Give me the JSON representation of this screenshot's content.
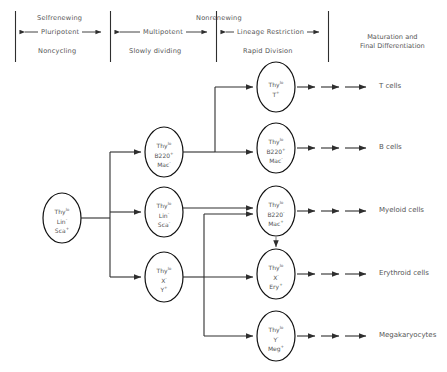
{
  "diagram": {
    "colors": {
      "line": "#3a3a3a",
      "text": "#555555",
      "oval_stroke": "#1a1a1a",
      "background": "#ffffff"
    },
    "stages": [
      {
        "id": "pluripotent",
        "top_label": "Selfrenewing",
        "arrow_label": "Pluripotent",
        "bottom_label": "Noncycling"
      },
      {
        "id": "multipotent",
        "top_label": "",
        "arrow_label": "Multipotent",
        "bottom_label": "Slowly dividing"
      },
      {
        "id": "lineage-restriction",
        "top_label": "Nonrenewing",
        "arrow_label": "Lineage Restriction",
        "bottom_label": "Rapid Division"
      }
    ],
    "maturation_label": {
      "line1": "Maturation and",
      "line2": "Final Differentiation"
    },
    "cells": {
      "stem": {
        "name": "pluripotent-stem-cell",
        "markers": [
          {
            "base": "Thy",
            "sup": "lo"
          },
          {
            "base": "Lin",
            "sup": "-"
          },
          {
            "base": "Sca",
            "sup": "+"
          }
        ]
      },
      "multipotent_lymphoid": {
        "name": "multipotent-lymphoid-progenitor",
        "markers": [
          {
            "base": "Thy",
            "sup": "lo"
          },
          {
            "base": "B220",
            "sup": "+"
          },
          {
            "base": "Mac",
            "sup": "-"
          }
        ]
      },
      "multipotent_mid": {
        "name": "multipotent-progenitor",
        "markers": [
          {
            "base": "Thy",
            "sup": "lo"
          },
          {
            "base": "Lin",
            "sup": "-"
          },
          {
            "base": "Sca",
            "sup": "-"
          }
        ]
      },
      "multipotent_lower": {
        "name": "multipotent-erythro-megakaryocyte-progenitor",
        "markers": [
          {
            "base": "Thy",
            "sup": "lo"
          },
          {
            "base": "X",
            "sup": "-"
          },
          {
            "base": "Y",
            "sup": "+"
          }
        ]
      },
      "t_progenitor": {
        "name": "t-cell-progenitor",
        "markers": [
          {
            "base": "Thy",
            "sup": "lo"
          },
          {
            "base": "T",
            "sup": "+"
          }
        ]
      },
      "b_progenitor": {
        "name": "b-cell-progenitor",
        "markers": [
          {
            "base": "Thy",
            "sup": "lo"
          },
          {
            "base": "B220",
            "sup": "+"
          },
          {
            "base": "Mac",
            "sup": "-"
          }
        ]
      },
      "myeloid_progenitor": {
        "name": "myeloid-progenitor",
        "markers": [
          {
            "base": "Thy",
            "sup": "lo"
          },
          {
            "base": "B220",
            "sup": "-"
          },
          {
            "base": "Mac",
            "sup": "+"
          }
        ]
      },
      "erythroid_progenitor": {
        "name": "erythroid-progenitor",
        "markers": [
          {
            "base": "Thy",
            "sup": "lo"
          },
          {
            "base": "X",
            "sup": "-"
          },
          {
            "base": "Ery",
            "sup": "+"
          }
        ]
      },
      "megakaryocyte_progenitor": {
        "name": "megakaryocyte-progenitor",
        "markers": [
          {
            "base": "Thy",
            "sup": "lo"
          },
          {
            "base": "Y",
            "sup": "-"
          },
          {
            "base": "Meg",
            "sup": "+"
          }
        ]
      }
    },
    "outputs": [
      {
        "id": "t-cells",
        "label": "T cells"
      },
      {
        "id": "b-cells",
        "label": "B cells"
      },
      {
        "id": "myeloid-cells",
        "label": "Myeloid cells"
      },
      {
        "id": "erythroid-cells",
        "label": "Erythroid cells"
      },
      {
        "id": "megakaryocytes",
        "label": "Megakaryocytes"
      }
    ]
  }
}
